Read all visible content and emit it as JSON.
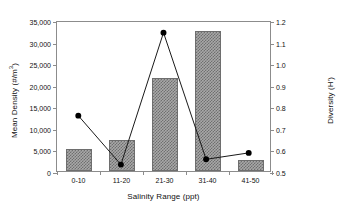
{
  "chart_data": {
    "type": "bar",
    "title": "",
    "categories": [
      "0-10",
      "11-20",
      "21-30",
      "31-40",
      "41-50"
    ],
    "xlabel": "Salinity Range  (ppt)",
    "ylabel": "Mean Density (#/m3)",
    "ylabel_prefix": "Mean Density (#/m",
    "ylabel_sup": "3",
    "ylabel_suffix": ")",
    "y2label": "Diversity (H')",
    "ylim": [
      0,
      35000
    ],
    "y2lim": [
      0.5,
      1.2
    ],
    "grid": false,
    "legend": "none",
    "yticks": [
      0,
      5000,
      10000,
      15000,
      20000,
      25000,
      30000,
      35000
    ],
    "yticklabels": [
      "0",
      "5,000",
      "10,000",
      "15,000",
      "20,000",
      "25,000",
      "30,000",
      "35,000"
    ],
    "y2ticks": [
      0.5,
      0.6,
      0.7,
      0.8,
      0.9,
      1.0,
      1.1,
      1.2
    ],
    "y2ticklabels": [
      "0.5",
      "0.6",
      "0.7",
      "0.8",
      "0.9",
      "1.0",
      "1.1",
      "1.2"
    ],
    "series": [
      {
        "name": "Mean Density",
        "type": "bar",
        "axis": "left",
        "values": [
          5200,
          7100,
          21500,
          32500,
          2500
        ]
      },
      {
        "name": "Diversity",
        "type": "line",
        "axis": "right",
        "values": [
          0.76,
          0.53,
          1.15,
          0.555,
          0.585
        ]
      }
    ],
    "colors": {
      "bar_fill": "#a8a8a8",
      "bar_hatch": "#6f6f6f",
      "bar_edge": "#6e6e6e",
      "line": "#1a1a1a",
      "marker": "#000000",
      "axis": "#8c8c8c",
      "background": "#ffffff"
    }
  }
}
